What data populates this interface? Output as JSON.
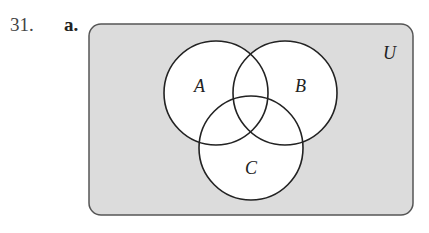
{
  "problem": {
    "number": "31.",
    "part": "a."
  },
  "diagram": {
    "type": "venn",
    "universe_label": "U",
    "sets": [
      {
        "label": "A"
      },
      {
        "label": "B"
      },
      {
        "label": "C"
      }
    ],
    "colors": {
      "universe_fill": "#dcdcdc",
      "circle_fill": "#ffffff",
      "stroke": "#222222"
    }
  }
}
